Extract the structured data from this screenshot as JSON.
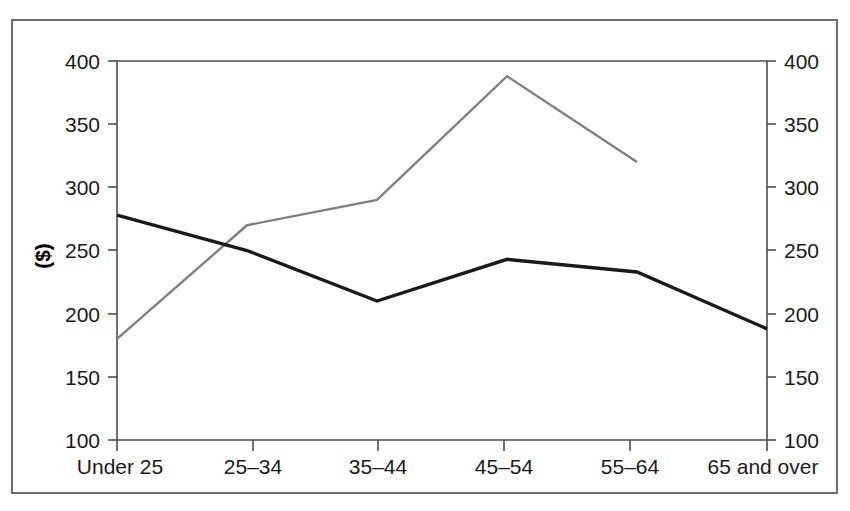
{
  "chart_data": {
    "type": "line",
    "title": "",
    "subtitle": "",
    "xlabel": "",
    "ylabel": "($)",
    "ylabel_right": "($)",
    "categories": [
      "Under 25",
      "25–34",
      "35–44",
      "45–54",
      "55–64",
      "65 and over"
    ],
    "ylim": [
      100,
      400
    ],
    "yticks": [
      100,
      150,
      200,
      250,
      300,
      350,
      400
    ],
    "ytick_labels": [
      "100",
      "150",
      "200",
      "250",
      "300",
      "350",
      "400"
    ],
    "ytick_labels_right": [
      "100",
      "150",
      "200",
      "250",
      "300",
      "350",
      "400"
    ],
    "grid": false,
    "legend": "none",
    "series": [
      {
        "name": "black-series",
        "color": "#1a1a1a",
        "stroke_width": 3.4,
        "x": [
          "Under 25",
          "25–34",
          "35–44",
          "45–54",
          "55–64",
          "65 and over"
        ],
        "values": [
          278,
          250,
          210,
          243,
          233,
          188
        ]
      },
      {
        "name": "gray-series",
        "color": "#808080",
        "stroke_width": 2.4,
        "x": [
          "Under 25",
          "25–34",
          "35–44",
          "45–54",
          "55–64"
        ],
        "values": [
          180,
          270,
          290,
          388,
          320
        ]
      }
    ]
  },
  "axes": {
    "left_title": "($)",
    "tick_000": "400",
    "tick_001": "350",
    "tick_002": "300",
    "tick_003": "250",
    "tick_004": "200",
    "tick_005": "150",
    "tick_006": "100",
    "r_tick_000": "400",
    "r_tick_001": "350",
    "r_tick_002": "300",
    "r_tick_003": "250",
    "r_tick_004": "200",
    "r_tick_005": "150",
    "r_tick_006": "100",
    "cat_0": "Under 25",
    "cat_1": "25–34",
    "cat_2": "35–44",
    "cat_3": "45–54",
    "cat_4": "55–64",
    "cat_5": "65 and over"
  },
  "colors": {
    "frame": "#6e6e6e",
    "axis": "#4d4d4d",
    "series_dark": "#1a1a1a",
    "series_gray": "#808080",
    "text": "#1a1a1a",
    "background": "#ffffff"
  }
}
